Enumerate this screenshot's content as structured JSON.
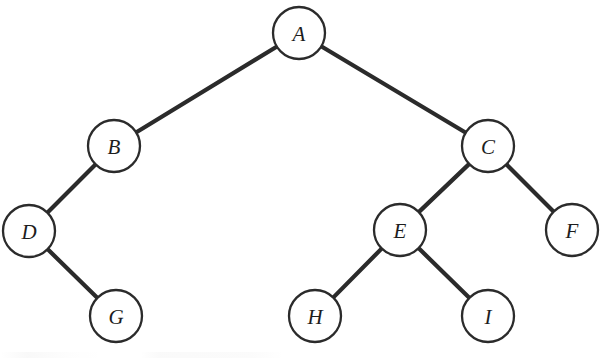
{
  "figure": {
    "type": "binary-tree-diagram",
    "background_color": "#ffffff",
    "node_fill_color": "#ffffff",
    "node_stroke_color": "#2b2b2b",
    "edge_color": "#2b2b2b",
    "label_color": "#1d1d1d",
    "node_radius": 26,
    "edge_width": 4.2,
    "node_stroke_width": 2.3,
    "canvas": {
      "width": 600,
      "height": 358
    }
  },
  "tree": {
    "root": "A",
    "node_count": 9,
    "edge_count": 8,
    "depth": 4,
    "nodes": [
      {
        "id": "A",
        "label": "A",
        "cx": 299,
        "cy": 33,
        "r": 26,
        "level": 0,
        "parent": null
      },
      {
        "id": "B",
        "label": "B",
        "cx": 114,
        "cy": 146,
        "r": 26,
        "level": 1,
        "parent": "A"
      },
      {
        "id": "C",
        "label": "C",
        "cx": 488,
        "cy": 146,
        "r": 26,
        "level": 1,
        "parent": "A"
      },
      {
        "id": "D",
        "label": "D",
        "cx": 29,
        "cy": 231,
        "r": 26,
        "level": 2,
        "parent": "B"
      },
      {
        "id": "E",
        "label": "E",
        "cx": 400,
        "cy": 230,
        "r": 26,
        "level": 2,
        "parent": "C"
      },
      {
        "id": "F",
        "label": "F",
        "cx": 572,
        "cy": 230,
        "r": 26,
        "level": 2,
        "parent": "C"
      },
      {
        "id": "G",
        "label": "G",
        "cx": 116,
        "cy": 316,
        "r": 26,
        "level": 3,
        "parent": "D"
      },
      {
        "id": "H",
        "label": "H",
        "cx": 315,
        "cy": 316,
        "r": 26,
        "level": 3,
        "parent": "E"
      },
      {
        "id": "I",
        "label": "I",
        "cx": 488,
        "cy": 316,
        "r": 26,
        "level": 3,
        "parent": "E"
      }
    ],
    "edges": [
      {
        "from": "A",
        "to": "B",
        "side": "left"
      },
      {
        "from": "A",
        "to": "C",
        "side": "right"
      },
      {
        "from": "B",
        "to": "D",
        "side": "left"
      },
      {
        "from": "C",
        "to": "E",
        "side": "left"
      },
      {
        "from": "C",
        "to": "F",
        "side": "right"
      },
      {
        "from": "D",
        "to": "G",
        "side": "right"
      },
      {
        "from": "E",
        "to": "H",
        "side": "left"
      },
      {
        "from": "E",
        "to": "I",
        "side": "right"
      }
    ]
  }
}
